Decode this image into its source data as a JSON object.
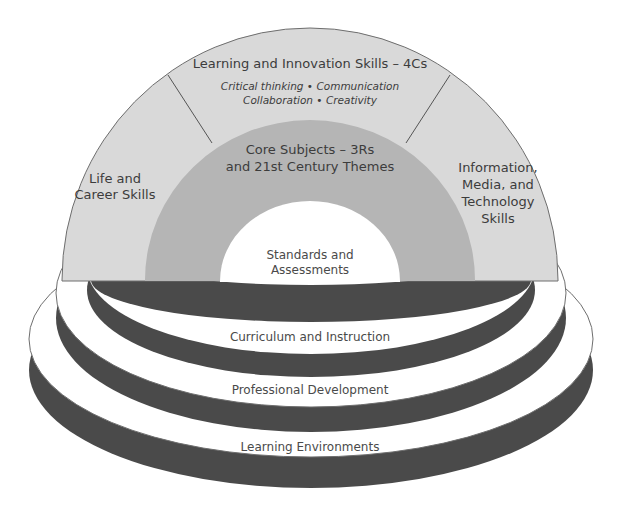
{
  "diagram": {
    "type": "rainbow-arch-over-stacked-platforms",
    "colors": {
      "outer_arch": "#d9d9d9",
      "core_arch": "#b5b5b5",
      "inner_arch": "#ffffff",
      "platform_top": "#ffffff",
      "platform_side": "#4a4a4a",
      "outline": "#6e6e6e",
      "text": "#3c3c3c"
    },
    "arch": {
      "outer_segments": {
        "left": {
          "line1": "Life and",
          "line2": "Career Skills"
        },
        "top": {
          "title": "Learning and Innovation Skills – 4Cs",
          "sub_line1": "Critical thinking • Communication",
          "sub_line2": "Collaboration • Creativity"
        },
        "right": {
          "line1": "Information,",
          "line2": "Media, and",
          "line3": "Technology",
          "line4": "Skills"
        }
      },
      "core": {
        "line1": "Core Subjects – 3Rs",
        "line2": "and 21st Century Themes"
      },
      "center": {
        "line1": "Standards and",
        "line2": "Assessments"
      }
    },
    "platforms": [
      {
        "label": "Curriculum and Instruction"
      },
      {
        "label": "Professional Development"
      },
      {
        "label": "Learning Environments"
      }
    ]
  }
}
